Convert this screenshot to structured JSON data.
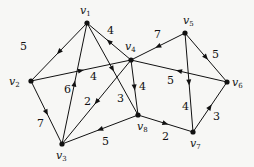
{
  "diagram": {
    "type": "weighted-directed-graph",
    "nodes": [
      {
        "id": "v1",
        "label": "v",
        "sub": "1",
        "x": 87,
        "y": 23,
        "lx": 80,
        "ly": 14
      },
      {
        "id": "v2",
        "label": "v",
        "sub": "2",
        "x": 31,
        "y": 81,
        "lx": 9,
        "ly": 85
      },
      {
        "id": "v3",
        "label": "v",
        "sub": "3",
        "x": 62,
        "y": 144,
        "lx": 56,
        "ly": 159
      },
      {
        "id": "v4",
        "label": "v",
        "sub": "4",
        "x": 131,
        "y": 60,
        "lx": 125,
        "ly": 50
      },
      {
        "id": "v5",
        "label": "v",
        "sub": "5",
        "x": 185,
        "y": 33,
        "lx": 183,
        "ly": 24
      },
      {
        "id": "v6",
        "label": "v",
        "sub": "6",
        "x": 227,
        "y": 82,
        "lx": 232,
        "ly": 86
      },
      {
        "id": "v7",
        "label": "v",
        "sub": "7",
        "x": 193,
        "y": 132,
        "lx": 190,
        "ly": 147
      },
      {
        "id": "v8",
        "label": "v",
        "sub": "8",
        "x": 138,
        "y": 115,
        "lx": 137,
        "ly": 130
      }
    ],
    "edges": [
      {
        "from": "v1",
        "to": "v2",
        "weight": "5",
        "wx": 20,
        "wy": 50
      },
      {
        "from": "v4",
        "to": "v1",
        "weight": "4",
        "wx": 107,
        "wy": 34
      },
      {
        "from": "v2",
        "to": "v4",
        "weight": "4",
        "wx": 90,
        "wy": 80
      },
      {
        "from": "v3",
        "to": "v1",
        "weight": "6",
        "wx": 64,
        "wy": 93
      },
      {
        "from": "v1",
        "to": "v8",
        "weight": "3",
        "wx": 117,
        "wy": 102
      },
      {
        "from": "v4",
        "to": "v3",
        "weight": "2",
        "wx": 84,
        "wy": 105
      },
      {
        "from": "v2",
        "to": "v3",
        "weight": "7",
        "wx": 37,
        "wy": 127
      },
      {
        "from": "v4",
        "to": "v8",
        "weight": "4",
        "wx": 139,
        "wy": 90
      },
      {
        "from": "v8",
        "to": "v3",
        "weight": "5",
        "wx": 102,
        "wy": 145
      },
      {
        "from": "v5",
        "to": "v4",
        "weight": "7",
        "wx": 154,
        "wy": 38
      },
      {
        "from": "v5",
        "to": "v6",
        "weight": "5",
        "wx": 212,
        "wy": 58
      },
      {
        "from": "v6",
        "to": "v4",
        "weight": "5",
        "wx": 167,
        "wy": 84
      },
      {
        "from": "v5",
        "to": "v7",
        "weight": "4",
        "wx": 182,
        "wy": 110
      },
      {
        "from": "v8",
        "to": "v7",
        "weight": "2",
        "wx": 162,
        "wy": 140
      },
      {
        "from": "v7",
        "to": "v6",
        "weight": "3",
        "wx": 213,
        "wy": 120
      }
    ]
  }
}
